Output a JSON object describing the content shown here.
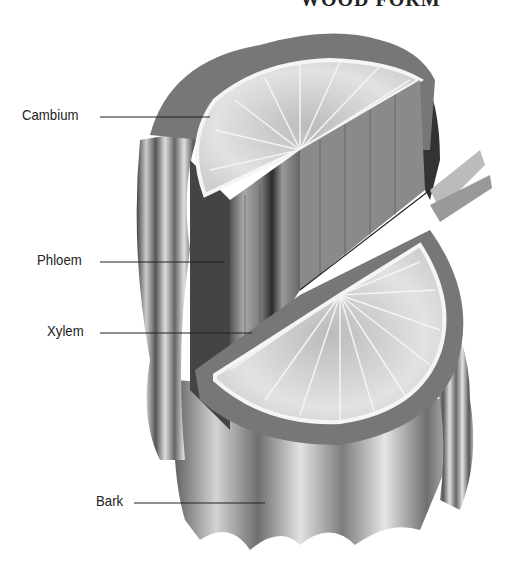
{
  "title": "WOOD FORM",
  "labels": {
    "cambium": "Cambium",
    "phloem": "Phloem",
    "xylem": "Xylem",
    "bark": "Bark"
  },
  "colors": {
    "ink": "#222222",
    "bark_dark": "#3a3a3a",
    "bark_mid": "#7a7a7a",
    "wood_light": "#dcdcdc",
    "cambium_ring": "#f2f2f2"
  }
}
